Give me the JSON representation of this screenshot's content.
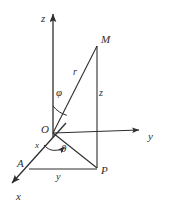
{
  "figure": {
    "type": "spherical-coordinates-diagram",
    "stroke_color": "#2e2e2e",
    "background_color": "#ffffff",
    "axes": [
      {
        "id": "z",
        "label": "z",
        "label_x": 41,
        "label_y": 13,
        "arrow_tip_x": 53,
        "arrow_tip_y": 10
      },
      {
        "id": "y",
        "label": "y",
        "label_x": 148,
        "label_y": 131,
        "arrow_tip_x": 143,
        "arrow_tip_y": 130
      },
      {
        "id": "x",
        "label": "x",
        "label_x": 16,
        "label_y": 191,
        "arrow_tip_x": 9,
        "arrow_tip_y": 186
      }
    ],
    "points": [
      {
        "id": "O",
        "label": "O",
        "x": 53,
        "y": 133,
        "label_x": 41,
        "label_y": 124
      },
      {
        "id": "M",
        "label": "M",
        "x": 97,
        "y": 46,
        "label_x": 101,
        "label_y": 34
      },
      {
        "id": "P",
        "label": "P",
        "x": 97,
        "y": 168,
        "label_x": 101,
        "label_y": 165
      },
      {
        "id": "A",
        "label": "A",
        "x": 29,
        "y": 169,
        "label_x": 17,
        "label_y": 158
      }
    ],
    "segment_labels": [
      {
        "id": "r",
        "label": "r",
        "x": 73,
        "y": 67
      },
      {
        "id": "z-seg",
        "label": "z",
        "x": 99,
        "y": 88
      },
      {
        "id": "y-seg",
        "label": "y",
        "x": 56,
        "y": 172
      },
      {
        "id": "x-seg",
        "label": "x",
        "x": 35,
        "y": 141
      }
    ],
    "angles": [
      {
        "id": "phi",
        "label": "φ",
        "x": 56,
        "y": 87,
        "between": "z-axis and OM"
      },
      {
        "id": "theta",
        "label": "θ",
        "x": 61,
        "y": 143,
        "between": "x-axis and OP"
      }
    ]
  }
}
